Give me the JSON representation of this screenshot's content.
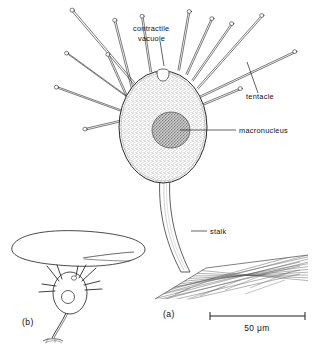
{
  "figure": {
    "background_color": "#ffffff",
    "ink_color": "#1f1f1f",
    "body_fill_color": "#d8d8d8",
    "nucleus_fill_color": "#a8a8a8",
    "vacuole_fill_color": "#ffffff"
  },
  "panels": [
    {
      "id": "a",
      "label": "(a)",
      "x": 163,
      "y": 317
    },
    {
      "id": "b",
      "label": "(b)",
      "x": 22,
      "y": 325
    }
  ],
  "labels": [
    {
      "id": "contractile-vacuole",
      "text_line1": "contractile",
      "text_line2": "vacuole",
      "text": "contractile vacuole",
      "x": 133,
      "y": 30,
      "anchor": "start",
      "leader": {
        "x1": 160,
        "y1": 41,
        "x2": 163,
        "y2": 63
      }
    },
    {
      "id": "tentacle",
      "text": "tentacle",
      "x": 246,
      "y": 99,
      "anchor": "start",
      "leader": {
        "x1": 258,
        "y1": 93,
        "x2": 247,
        "y2": 63
      }
    },
    {
      "id": "macronucleus",
      "text": "macronucleus",
      "x": 239,
      "y": 133,
      "anchor": "start",
      "leader": {
        "x1": 236,
        "y1": 130,
        "x2": 178,
        "y2": 130
      }
    },
    {
      "id": "stalk",
      "text": "stalk",
      "x": 210,
      "y": 234,
      "anchor": "start",
      "leader": {
        "x1": 207,
        "y1": 231,
        "x2": 192,
        "y2": 231
      }
    }
  ],
  "scale_bar": {
    "label": "50 μm",
    "value": 50,
    "unit": "μm",
    "x1": 210,
    "x2": 305,
    "y": 316,
    "tick_height": 5,
    "label_x": 257,
    "label_y": 331
  },
  "cell_body": {
    "center_x": 163,
    "center_y": 127,
    "radius_x": 44,
    "radius_y": 56
  },
  "macronucleus_shape": {
    "center_x": 171,
    "center_y": 130,
    "radius_x": 19,
    "radius_y": 18
  },
  "contractile_vacuole_shape": {
    "center_x": 163,
    "center_y": 74,
    "radius_x": 6,
    "radius_y": 5
  },
  "tentacles": [
    {
      "base_x": 137,
      "base_y": 88,
      "tip_x": 71,
      "tip_y": 10
    },
    {
      "base_x": 133,
      "base_y": 95,
      "tip_x": 115,
      "tip_y": 20
    },
    {
      "base_x": 131,
      "base_y": 99,
      "tip_x": 66,
      "tip_y": 52
    },
    {
      "base_x": 129,
      "base_y": 103,
      "tip_x": 107,
      "tip_y": 54
    },
    {
      "base_x": 127,
      "base_y": 112,
      "tip_x": 56,
      "tip_y": 86
    },
    {
      "base_x": 130,
      "base_y": 118,
      "tip_x": 85,
      "tip_y": 128
    },
    {
      "base_x": 150,
      "base_y": 72,
      "tip_x": 142,
      "tip_y": 16
    },
    {
      "base_x": 178,
      "base_y": 70,
      "tip_x": 189,
      "tip_y": 11
    },
    {
      "base_x": 186,
      "base_y": 74,
      "tip_x": 212,
      "tip_y": 18
    },
    {
      "base_x": 192,
      "base_y": 80,
      "tip_x": 232,
      "tip_y": 23
    },
    {
      "base_x": 197,
      "base_y": 88,
      "tip_x": 262,
      "tip_y": 15
    },
    {
      "base_x": 200,
      "base_y": 96,
      "tip_x": 295,
      "tip_y": 51
    },
    {
      "base_x": 202,
      "base_y": 104,
      "tip_x": 240,
      "tip_y": 88
    }
  ],
  "stalk": {
    "top_x": 168,
    "top_y": 182,
    "bottom_x": 190,
    "bottom_y": 272,
    "width": 7
  },
  "substrate": {
    "hatch_count": 22,
    "left_x": 155,
    "right_x": 308,
    "top_y": 255,
    "bottom_y": 300
  },
  "panel_b": {
    "leaf": {
      "center_x": 78,
      "center_y": 249,
      "radius_x": 68,
      "radius_y": 17
    },
    "cell": {
      "center_x": 70,
      "center_y": 293,
      "radius_x": 17,
      "radius_y": 21
    },
    "nucleus": {
      "center_x": 68,
      "center_y": 296,
      "radius_x": 6,
      "radius_y": 6
    },
    "vacuole": {
      "center_x": 73,
      "center_y": 278,
      "radius_x": 3,
      "radius_y": 2.5
    },
    "tentacle_count": 9,
    "stalk_top_y": 314,
    "stalk_bottom_y": 340
  }
}
